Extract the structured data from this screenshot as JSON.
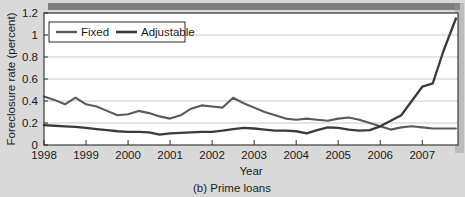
{
  "figure": {
    "caption": "(b) Prime loans",
    "background_color": "#d9d9d9",
    "plot_background_color": "#ffffff",
    "top_shadow_band_color": "#6e6e6e"
  },
  "chart_data": {
    "type": "line",
    "title": "",
    "subtitle": "",
    "caption": "(b) Prime loans",
    "xlabel": "Year",
    "ylabel": "Foreclosure rate (percent)",
    "xlim": [
      1998.0,
      2007.85
    ],
    "ylim": [
      0,
      1.2
    ],
    "yticks": [
      0,
      0.2,
      0.4,
      0.6,
      0.8,
      1,
      1.2
    ],
    "ytick_labels": [
      "0",
      "0.2",
      "0.4",
      "0.6",
      "0.8",
      "1",
      "1.2"
    ],
    "xticks": [
      1998,
      1999,
      2000,
      2001,
      2002,
      2003,
      2004,
      2005,
      2006,
      2007
    ],
    "xtick_labels": [
      "1998",
      "1999",
      "2000",
      "2001",
      "2002",
      "2003",
      "2004",
      "2005",
      "2006",
      "2007"
    ],
    "grid": "horizontal",
    "legend_position": "top-left",
    "series": [
      {
        "name": "Fixed",
        "color": "#5a5a5a",
        "line_width": 2.1,
        "x": [
          1998.0,
          1998.25,
          1998.5,
          1998.75,
          1999.0,
          1999.25,
          1999.5,
          1999.75,
          2000.0,
          2000.25,
          2000.5,
          2000.75,
          2001.0,
          2001.25,
          2001.5,
          2001.75,
          2002.0,
          2002.25,
          2002.5,
          2002.75,
          2003.0,
          2003.25,
          2003.5,
          2003.75,
          2004.0,
          2004.25,
          2004.5,
          2004.75,
          2005.0,
          2005.25,
          2005.5,
          2005.75,
          2006.0,
          2006.25,
          2006.5,
          2006.75,
          2007.0,
          2007.25,
          2007.5,
          2007.8
        ],
        "values": [
          0.44,
          0.41,
          0.37,
          0.43,
          0.37,
          0.35,
          0.31,
          0.27,
          0.28,
          0.31,
          0.29,
          0.26,
          0.24,
          0.27,
          0.33,
          0.36,
          0.35,
          0.34,
          0.43,
          0.38,
          0.34,
          0.3,
          0.27,
          0.24,
          0.23,
          0.24,
          0.23,
          0.22,
          0.24,
          0.25,
          0.23,
          0.2,
          0.17,
          0.14,
          0.16,
          0.17,
          0.16,
          0.15,
          0.15,
          0.15
        ]
      },
      {
        "name": "Adjustable",
        "color": "#3a3a3a",
        "line_width": 2.3,
        "x": [
          1998.0,
          1998.25,
          1998.5,
          1998.75,
          1999.0,
          1999.25,
          1999.5,
          1999.75,
          2000.0,
          2000.25,
          2000.5,
          2000.75,
          2001.0,
          2001.25,
          2001.5,
          2001.75,
          2002.0,
          2002.25,
          2002.5,
          2002.75,
          2003.0,
          2003.25,
          2003.5,
          2003.75,
          2004.0,
          2004.25,
          2004.5,
          2004.75,
          2005.0,
          2005.25,
          2005.5,
          2005.75,
          2006.0,
          2006.25,
          2006.5,
          2006.75,
          2007.0,
          2007.25,
          2007.5,
          2007.8
        ],
        "values": [
          0.18,
          0.175,
          0.17,
          0.165,
          0.155,
          0.145,
          0.135,
          0.125,
          0.12,
          0.12,
          0.115,
          0.095,
          0.105,
          0.11,
          0.115,
          0.12,
          0.12,
          0.13,
          0.145,
          0.155,
          0.15,
          0.14,
          0.13,
          0.13,
          0.125,
          0.105,
          0.135,
          0.16,
          0.155,
          0.14,
          0.13,
          0.135,
          0.17,
          0.22,
          0.27,
          0.4,
          0.53,
          0.56,
          0.85,
          1.15
        ]
      }
    ]
  },
  "legend": {
    "items": [
      {
        "label": "Fixed",
        "color": "#5a5a5a"
      },
      {
        "label": "Adjustable",
        "color": "#3a3a3a"
      }
    ]
  }
}
